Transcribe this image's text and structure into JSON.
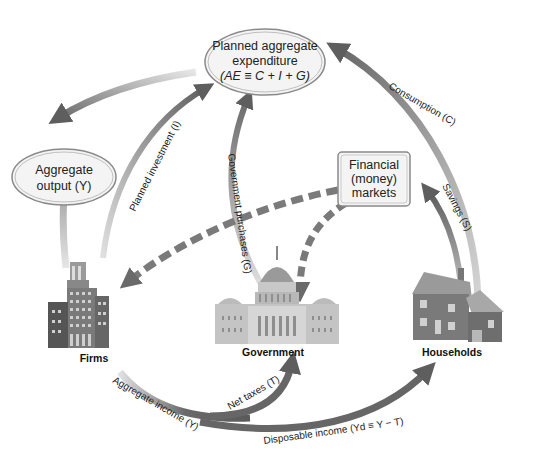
{
  "nodes": {
    "planned_ae": {
      "line1": "Planned aggregate",
      "line2": "expenditure",
      "line3": "(AE ≡ C + I + G)"
    },
    "aggregate_output": {
      "line1": "Aggregate",
      "line2": "output (Y)"
    },
    "financial_markets": {
      "line1": "Financial",
      "line2": "(money)",
      "line3": "markets"
    }
  },
  "sectors": {
    "firms": "Firms",
    "government": "Government",
    "households": "Households"
  },
  "flows": {
    "consumption": "Consumption (C)",
    "savings": "Savings (S)",
    "planned_investment": "Planned investment (I)",
    "government_purchases": "Government purchases (G)",
    "net_taxes": "Net taxes (T)",
    "aggregate_income": "Aggregate income (Y)",
    "disposable_income": "Disposable income (Yd ≡ Y − T)"
  },
  "colors": {
    "arrow_dark": "#6e6e6e",
    "arrow_light": "#d4d4d4",
    "node_fill": "#f2f2f2",
    "node_stroke": "#8a8a8a"
  }
}
